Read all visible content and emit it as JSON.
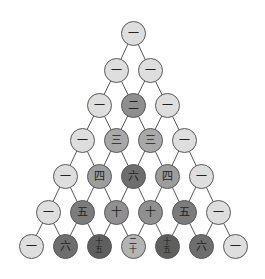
{
  "diagram": {
    "title": "",
    "type": "pascal-triangle",
    "numeral_system": "chinese",
    "rows": [
      [
        {
          "value": 1,
          "label": "一"
        }
      ],
      [
        {
          "value": 1,
          "label": "一"
        },
        {
          "value": 1,
          "label": "一"
        }
      ],
      [
        {
          "value": 1,
          "label": "一"
        },
        {
          "value": 2,
          "label": "二"
        },
        {
          "value": 1,
          "label": "一"
        }
      ],
      [
        {
          "value": 1,
          "label": "一"
        },
        {
          "value": 3,
          "label": "三"
        },
        {
          "value": 3,
          "label": "三"
        },
        {
          "value": 1,
          "label": "一"
        }
      ],
      [
        {
          "value": 1,
          "label": "一"
        },
        {
          "value": 4,
          "label": "四"
        },
        {
          "value": 6,
          "label": "六"
        },
        {
          "value": 4,
          "label": "四"
        },
        {
          "value": 1,
          "label": "一"
        }
      ],
      [
        {
          "value": 1,
          "label": "一"
        },
        {
          "value": 5,
          "label": "五"
        },
        {
          "value": 10,
          "label": "十"
        },
        {
          "value": 10,
          "label": "十"
        },
        {
          "value": 5,
          "label": "五"
        },
        {
          "value": 1,
          "label": "一"
        }
      ],
      [
        {
          "value": 1,
          "label": "一"
        },
        {
          "value": 6,
          "label": "六"
        },
        {
          "value": 15,
          "label": "十五"
        },
        {
          "value": 20,
          "label": "二十"
        },
        {
          "value": 15,
          "label": "十五"
        },
        {
          "value": 6,
          "label": "六"
        },
        {
          "value": 1,
          "label": "一"
        }
      ]
    ],
    "colors": {
      "1": "#dedede",
      "2": "#8f8f8f",
      "3": "#a8a8a8",
      "4": "#9d9d9d",
      "5": "#7c7c7c",
      "6": "#6e6e6e",
      "10": "#909090",
      "15": "#5f5f5f",
      "20": "#b4b4b4",
      "edge": "#555555",
      "node_border": "#5a5a5a"
    },
    "layout": {
      "row_y": [
        33,
        70,
        105,
        140,
        176,
        212,
        246
      ],
      "col_spacing": 34,
      "center_x": 133,
      "node_diameter": 25
    }
  }
}
